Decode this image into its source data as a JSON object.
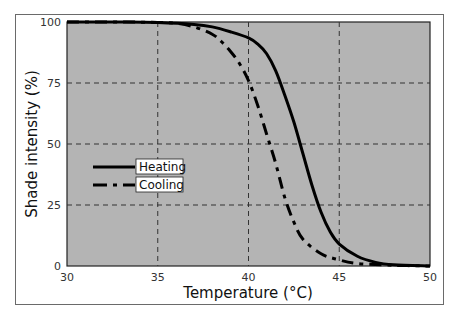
{
  "chart_data": {
    "type": "line",
    "title": "",
    "xlabel": "Temperature (°C)",
    "ylabel": "Shade intensity (%)",
    "xlim": [
      30,
      50
    ],
    "ylim": [
      0,
      100
    ],
    "x_ticks": [
      "30",
      "35",
      "40",
      "45",
      "50"
    ],
    "y_ticks": [
      "0",
      "25",
      "50",
      "75",
      "100"
    ],
    "grid": true,
    "background": "#b4b4b4",
    "legend_position": "center-left",
    "series": [
      {
        "name": "Heating",
        "style": "solid",
        "x": [
          30,
          33,
          35,
          37,
          38,
          39,
          40,
          40.5,
          41,
          41.5,
          42,
          42.5,
          43,
          43.5,
          44,
          44.5,
          45,
          46,
          47,
          48,
          50
        ],
        "values": [
          100,
          100,
          99.8,
          99,
          98,
          96,
          93.5,
          91,
          87,
          80,
          70,
          59,
          46,
          33,
          22,
          14,
          9,
          4,
          1.5,
          0.5,
          0
        ]
      },
      {
        "name": "Cooling",
        "style": "dash-dot",
        "x": [
          30,
          33,
          35,
          36,
          37,
          38,
          38.5,
          39,
          39.5,
          40,
          40.5,
          41,
          41.5,
          42,
          42.5,
          43,
          44,
          45,
          46,
          48,
          50
        ],
        "values": [
          100,
          100,
          99.8,
          99.5,
          98,
          95,
          92,
          88,
          83,
          76,
          66,
          54,
          42,
          28,
          18,
          11,
          5,
          2.5,
          1,
          0.3,
          0
        ]
      }
    ]
  },
  "axes": {
    "xlabel": "Temperature (°C)",
    "ylabel": "Shade intensity (%)",
    "x_ticks": [
      "30",
      "35",
      "40",
      "45",
      "50"
    ],
    "y_ticks": [
      "0",
      "25",
      "50",
      "75",
      "100"
    ]
  },
  "legend": {
    "heating": "Heating",
    "cooling": "Cooling"
  },
  "colors": {
    "plot_bg": "#b4b4b4",
    "line": "#000000",
    "grid": "#333333"
  }
}
